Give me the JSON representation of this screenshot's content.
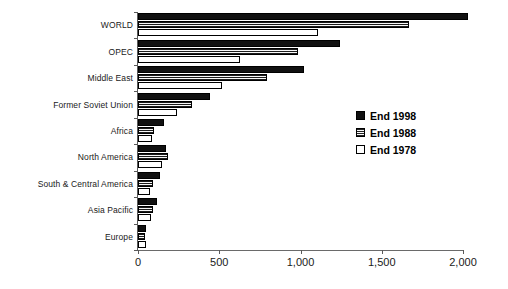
{
  "chart_data": {
    "type": "bar",
    "orientation": "horizontal",
    "title": "",
    "subtitle": "",
    "xlabel": "",
    "ylabel": "",
    "xlim": [
      0,
      2000
    ],
    "xticks": [
      0,
      500,
      1000,
      1500,
      2000
    ],
    "xticklabels": [
      "0",
      "500",
      "1,000",
      "1,500",
      "2,000"
    ],
    "grid": false,
    "legend_position": "center-right",
    "categories": [
      "WORLD",
      "OPEC",
      "Middle East",
      "Former Soviet Union",
      "Africa",
      "North America",
      "South & Central America",
      "Asia Pacific",
      "Europe"
    ],
    "series": [
      {
        "name": "End 1998",
        "color": "#111111",
        "values": [
          2030,
          1245,
          1020,
          445,
          160,
          175,
          135,
          115,
          50
        ]
      },
      {
        "name": "End 1988",
        "color": "#b9b9b9",
        "values": [
          1665,
          985,
          795,
          335,
          100,
          185,
          95,
          95,
          43
        ]
      },
      {
        "name": "End 1978",
        "color": "#ffffff",
        "values": [
          1110,
          630,
          515,
          240,
          88,
          150,
          75,
          78,
          50
        ]
      }
    ]
  },
  "legend": {
    "items": [
      {
        "label": "End 1998",
        "swatch": "black-filled-swatch"
      },
      {
        "label": "End 1988",
        "swatch": "gray-hatched-swatch"
      },
      {
        "label": "End 1978",
        "swatch": "white-outline-swatch"
      }
    ]
  }
}
